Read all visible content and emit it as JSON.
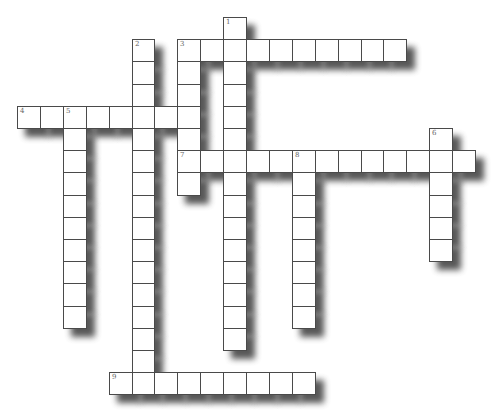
{
  "puzzle": {
    "type": "crossword",
    "grid": {
      "origin_x": 17,
      "origin_y": 17,
      "cell_w": 22.9,
      "cell_h": 22.2
    },
    "colors": {
      "cell_bg": "#ffffff",
      "cell_border": "#4a4a4a",
      "shadow": "#3a3a3a",
      "number": "#666666"
    },
    "words": [
      {
        "number": "1",
        "direction": "down",
        "col": 9,
        "row": 0,
        "length": 15
      },
      {
        "number": "2",
        "direction": "down",
        "col": 5,
        "row": 1,
        "length": 16
      },
      {
        "number": "3",
        "direction": "across",
        "col": 7,
        "row": 1,
        "length": 10
      },
      {
        "number": "3",
        "direction": "down",
        "col": 7,
        "row": 1,
        "length": 7
      },
      {
        "number": "4",
        "direction": "across",
        "col": 0,
        "row": 4,
        "length": 8
      },
      {
        "number": "5",
        "direction": "down",
        "col": 2,
        "row": 4,
        "length": 10
      },
      {
        "number": "6",
        "direction": "down",
        "col": 18,
        "row": 5,
        "length": 6
      },
      {
        "number": "7",
        "direction": "across",
        "col": 7,
        "row": 6,
        "length": 13
      },
      {
        "number": "8",
        "direction": "down",
        "col": 12,
        "row": 6,
        "length": 8
      },
      {
        "number": "9",
        "direction": "across",
        "col": 4,
        "row": 16,
        "length": 9
      }
    ]
  }
}
